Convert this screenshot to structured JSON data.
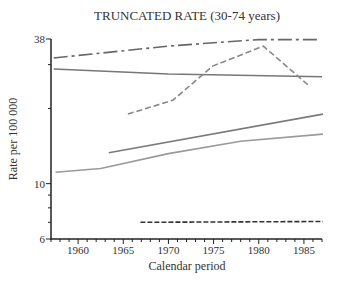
{
  "chart_data": {
    "type": "line",
    "title": "TRUNCATED RATE (30-74 years)",
    "xlabel": "Calendar period",
    "ylabel": "Rate per 100 000",
    "xlim": [
      1957,
      1987
    ],
    "ylim": [
      6,
      38
    ],
    "yscale": "log",
    "x_ticks": [
      1960,
      1965,
      1970,
      1975,
      1980,
      1985
    ],
    "y_tick_labels": [
      6,
      10,
      38
    ],
    "y_minor_ticks": [
      7,
      8,
      9,
      20,
      30
    ],
    "grid": false,
    "legend": null,
    "series": [
      {
        "name": "dash-dot (top)",
        "style": "dash-dot",
        "color": "#666666",
        "x": [
          1957.3,
          1970,
          1975,
          1980,
          1986.7
        ],
        "values": [
          31.9,
          35.6,
          36.7,
          37.8,
          37.8
        ]
      },
      {
        "name": "solid (upper)",
        "style": "solid",
        "color": "#777777",
        "x": [
          1957.3,
          1970,
          1987
        ],
        "values": [
          28.8,
          27.5,
          26.8
        ]
      },
      {
        "name": "dashed (peaked)",
        "style": "dashed",
        "color": "#888888",
        "x": [
          1965.5,
          1970.5,
          1974.9,
          1980.5,
          1985.6
        ],
        "values": [
          19.0,
          21.6,
          29.6,
          35.6,
          24.6
        ]
      },
      {
        "name": "solid (middle)",
        "style": "solid",
        "color": "#7a7a7a",
        "x": [
          1963.4,
          1987.1
        ],
        "values": [
          13.3,
          19.0
        ]
      },
      {
        "name": "solid (lower, light)",
        "style": "solid",
        "color": "#9a9a9a",
        "x": [
          1957.5,
          1962.5,
          1970,
          1978,
          1987.1
        ],
        "values": [
          11.1,
          11.5,
          13.2,
          14.8,
          15.8
        ]
      },
      {
        "name": "dashed (bottom)",
        "style": "dashed",
        "color": "#333333",
        "x": [
          1966.9,
          1987.1
        ],
        "values": [
          7.0,
          7.05
        ]
      }
    ]
  }
}
